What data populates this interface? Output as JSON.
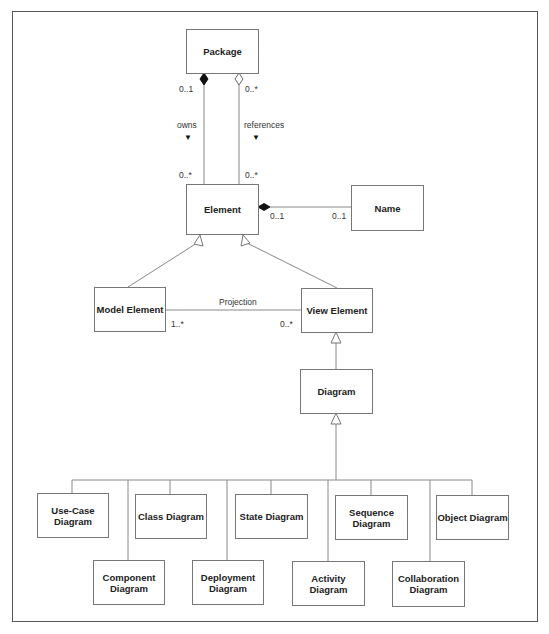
{
  "diagram": {
    "type": "uml-class-diagram",
    "boxes": {
      "package": "Package",
      "element": "Element",
      "name": "Name",
      "model_element": "Model Element",
      "view_element": "View Element",
      "diagram": "Diagram",
      "use_case": "Use-Case Diagram",
      "class": "Class Diagram",
      "state": "State Diagram",
      "sequence": "Sequence Diagram",
      "object": "Object Diagram",
      "component": "Component Diagram",
      "deployment": "Deployment Diagram",
      "activity": "Activity Diagram",
      "collaboration": "Collaboration Diagram"
    },
    "associations": {
      "owns": {
        "label": "owns",
        "direction_glyph": "▼",
        "from": "Package",
        "to": "Element",
        "kind": "composition",
        "package_multiplicity": "0..1",
        "element_multiplicity": "0..*"
      },
      "references": {
        "label": "references",
        "direction_glyph": "▼",
        "from": "Package",
        "to": "Element",
        "kind": "aggregation",
        "package_multiplicity": "0..*",
        "element_multiplicity": "0..*"
      },
      "element_name": {
        "from": "Element",
        "to": "Name",
        "kind": "composition",
        "element_multiplicity": "0..1",
        "name_multiplicity": "0..1"
      },
      "projection": {
        "label": "Projection",
        "from": "Model Element",
        "to": "View Element",
        "model_multiplicity": "1..*",
        "view_multiplicity": "0..*"
      }
    },
    "generalizations": [
      {
        "child": "Model Element",
        "parent": "Element"
      },
      {
        "child": "View Element",
        "parent": "Element"
      },
      {
        "child": "Diagram",
        "parent": "View Element"
      },
      {
        "child": "Use-Case Diagram",
        "parent": "Diagram"
      },
      {
        "child": "Class Diagram",
        "parent": "Diagram"
      },
      {
        "child": "State Diagram",
        "parent": "Diagram"
      },
      {
        "child": "Sequence Diagram",
        "parent": "Diagram"
      },
      {
        "child": "Object Diagram",
        "parent": "Diagram"
      },
      {
        "child": "Component Diagram",
        "parent": "Diagram"
      },
      {
        "child": "Deployment Diagram",
        "parent": "Diagram"
      },
      {
        "child": "Activity Diagram",
        "parent": "Diagram"
      },
      {
        "child": "Collaboration Diagram",
        "parent": "Diagram"
      }
    ],
    "colors": {
      "line": "#777777",
      "text": "#222222",
      "frame": "#555555"
    }
  }
}
